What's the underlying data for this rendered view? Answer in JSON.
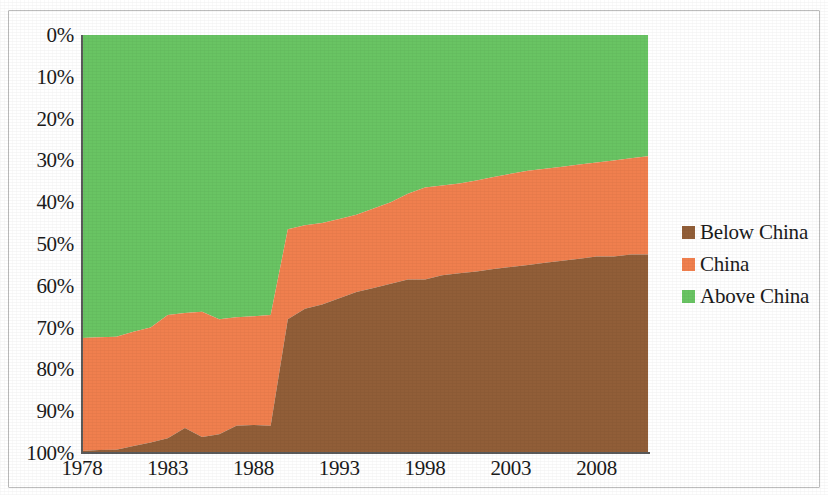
{
  "chart_data": {
    "type": "area",
    "stacked": true,
    "normalized": true,
    "title": "",
    "subtitle": "",
    "xlabel": "",
    "ylabel": "",
    "xlim": [
      1978,
      2011
    ],
    "ylim": [
      0,
      100
    ],
    "y_axis_inverted": true,
    "grid": false,
    "legend_position": "right",
    "y_tick_labels": [
      "0%",
      "10%",
      "20%",
      "30%",
      "40%",
      "50%",
      "60%",
      "70%",
      "80%",
      "90%",
      "100%"
    ],
    "y_tick_values": [
      0,
      10,
      20,
      30,
      40,
      50,
      60,
      70,
      80,
      90,
      100
    ],
    "x_tick_labels": [
      "1978",
      "1983",
      "1988",
      "1993",
      "1998",
      "2003",
      "2008"
    ],
    "x_tick_values": [
      1978,
      1983,
      1988,
      1993,
      1998,
      2003,
      2008
    ],
    "x": [
      1978,
      1979,
      1980,
      1981,
      1982,
      1983,
      1984,
      1985,
      1986,
      1987,
      1988,
      1989,
      1990,
      1991,
      1992,
      1993,
      1994,
      1995,
      1996,
      1997,
      1998,
      1999,
      2000,
      2001,
      2002,
      2003,
      2004,
      2005,
      2006,
      2007,
      2008,
      2009,
      2010,
      2011
    ],
    "series": [
      {
        "name": "Above China",
        "color": "#69C463",
        "stack_order": 1,
        "values": [
          72.5,
          72.3,
          72.2,
          71.0,
          70.0,
          67.0,
          66.5,
          66.2,
          68.0,
          67.5,
          67.3,
          67.0,
          46.5,
          45.5,
          45.0,
          44.0,
          43.0,
          41.5,
          40.0,
          38.0,
          36.5,
          36.0,
          35.5,
          34.8,
          34.0,
          33.2,
          32.5,
          32.0,
          31.5,
          31.0,
          30.5,
          30.0,
          29.5,
          29.0
        ]
      },
      {
        "name": "China",
        "color": "#F07F4E",
        "stack_order": 2,
        "values": [
          27.0,
          27.0,
          27.0,
          27.3,
          27.5,
          29.5,
          27.5,
          30.0,
          27.5,
          26.0,
          26.0,
          26.5,
          21.5,
          20.0,
          19.5,
          19.0,
          18.5,
          19.0,
          19.5,
          20.5,
          22.0,
          21.5,
          21.5,
          21.8,
          22.0,
          22.3,
          22.5,
          22.5,
          22.5,
          22.5,
          22.5,
          23.0,
          23.0,
          23.5
        ]
      },
      {
        "name": "Below China",
        "color": "#915E38",
        "stack_order": 3,
        "values": [
          0.5,
          0.7,
          0.8,
          1.7,
          2.5,
          3.5,
          6.0,
          3.8,
          4.5,
          6.5,
          6.7,
          6.5,
          32.0,
          34.5,
          35.5,
          37.0,
          38.5,
          39.5,
          40.5,
          41.5,
          41.5,
          42.5,
          43.0,
          43.4,
          44.0,
          44.5,
          45.0,
          45.5,
          46.0,
          46.5,
          47.0,
          47.0,
          47.5,
          47.5
        ]
      }
    ],
    "boundary_above_china_cumulative": [
      72.5,
      72.3,
      72.2,
      71.0,
      70.0,
      67.0,
      66.5,
      66.2,
      68.0,
      67.5,
      67.3,
      67.0,
      46.5,
      45.5,
      45.0,
      44.0,
      43.0,
      41.5,
      40.0,
      38.0,
      36.5,
      36.0,
      35.5,
      34.8,
      34.0,
      33.2,
      32.5,
      32.0,
      31.5,
      31.0,
      30.5,
      30.0,
      29.5,
      29.0
    ],
    "boundary_china_cumulative": [
      99.5,
      99.3,
      99.2,
      98.3,
      97.5,
      96.5,
      94.0,
      96.2,
      95.5,
      93.5,
      93.3,
      93.5,
      68.0,
      65.5,
      64.5,
      63.0,
      61.5,
      60.5,
      59.5,
      58.5,
      58.5,
      57.5,
      57.0,
      56.6,
      56.0,
      55.5,
      55.0,
      54.5,
      54.0,
      53.5,
      53.0,
      53.0,
      52.5,
      52.5
    ]
  },
  "legend": {
    "items": [
      {
        "label": "Below China",
        "color": "#915E38"
      },
      {
        "label": "China",
        "color": "#F07F4E"
      },
      {
        "label": "Above China",
        "color": "#69C463"
      }
    ]
  },
  "colors": {
    "below_china": "#915E38",
    "china": "#F07F4E",
    "above_china": "#69C463",
    "axis": "#5a5a5a",
    "text": "#1b1b1b",
    "frame": "#bdbdbd",
    "background": "#ffffff"
  }
}
